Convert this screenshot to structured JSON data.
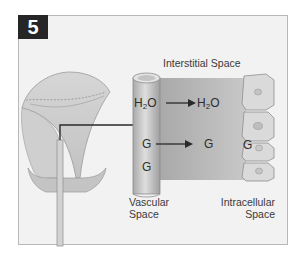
{
  "figure": {
    "number": "5",
    "labels": {
      "interstitial": "Interstitial Space",
      "vascular_line1": "Vascular",
      "vascular_line2": "Space",
      "intracellular_line1": "Intracellular",
      "intracellular_line2": "Space"
    },
    "molecules": {
      "water_left_main": "H",
      "water_left_sub": "2",
      "water_left_tail": "O",
      "water_right_main": "H",
      "water_right_sub": "2",
      "water_right_tail": "O",
      "glucose_vascular_1": "G",
      "glucose_interstitial": "G",
      "glucose_cell": "G",
      "glucose_vascular_2": "G"
    },
    "colors": {
      "frame_bg": "#f2f2f2",
      "badge_bg": "#262626",
      "interstitial_fill": "#b8b8b8",
      "vessel_fill": "#c9c9c9",
      "cell_fill": "#dcdcdc",
      "arrow": "#2a2a2a"
    }
  }
}
